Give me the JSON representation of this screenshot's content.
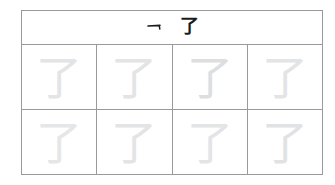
{
  "worksheet": {
    "title": "Chinese character tracing practice sheet",
    "character": "了",
    "header": {
      "stroke_hint_icon": "horizontal-hook-stroke-icon",
      "stroke_hint_label": "乛",
      "model_character": "了"
    },
    "grid": {
      "columns": 4,
      "rows": 2,
      "cells": [
        {
          "character": "了",
          "shade": "#e2e4e6"
        },
        {
          "character": "了",
          "shade": "#e2e4e6"
        },
        {
          "character": "了",
          "shade": "#dcdee0"
        },
        {
          "character": "了",
          "shade": "#e2e4e6"
        },
        {
          "character": "了",
          "shade": "#e4e6e8"
        },
        {
          "character": "了",
          "shade": "#e2e4e6"
        },
        {
          "character": "了",
          "shade": "#e2e4e6"
        },
        {
          "character": "了",
          "shade": "#e0e2e4"
        }
      ]
    },
    "colors": {
      "page_background": "#ffffff",
      "grid_line": "#9a9a9a",
      "model_ink": "#1b1b1b",
      "trace_ink": "#e2e4e6"
    }
  }
}
